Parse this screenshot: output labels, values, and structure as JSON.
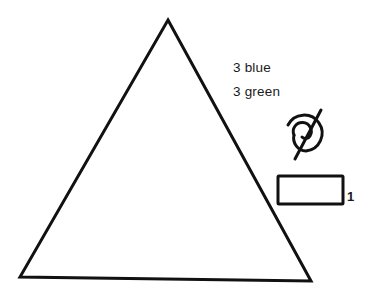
{
  "diagram": {
    "shapes": {
      "triangle": {
        "points": [
          [
            168,
            20
          ],
          [
            311,
            281
          ],
          [
            20,
            277
          ]
        ],
        "stroke": "#111111",
        "stroke_width": 3,
        "fill": "none"
      },
      "spiral_symbol": {
        "center": [
          306,
          131
        ],
        "stroke": "#111111",
        "stroke_width": 3
      },
      "rectangle": {
        "x": 278,
        "y": 176,
        "width": 65,
        "height": 28,
        "stroke": "#111111",
        "stroke_width": 3,
        "fill": "none"
      }
    },
    "labels": {
      "blue_count": "3 blue",
      "green_count": "3 green",
      "rectangle_count": "1"
    }
  }
}
